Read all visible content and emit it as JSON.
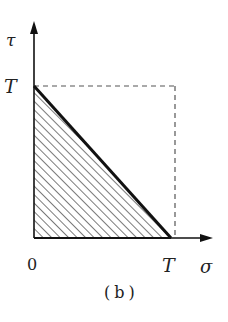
{
  "figure": {
    "caption": "(b)",
    "axes": {
      "y_label": "τ",
      "x_label": "σ",
      "origin_label": "0",
      "y_tick_label": "T",
      "x_tick_label": "T"
    },
    "region": {
      "shape": "right-triangle",
      "vertices": [
        [
          "0",
          "0"
        ],
        [
          "T",
          "0"
        ],
        [
          "0",
          "T"
        ]
      ],
      "fill": "diagonal-hatch",
      "boundary": "σ + τ = T"
    },
    "reference_square": {
      "style": "dashed",
      "corners": [
        [
          "0",
          "T"
        ],
        [
          "T",
          "T"
        ],
        [
          "T",
          "0"
        ]
      ]
    },
    "colors": {
      "line": "#111111",
      "hatch": "#333333",
      "dashed": "#555555",
      "text": "#222222"
    }
  }
}
